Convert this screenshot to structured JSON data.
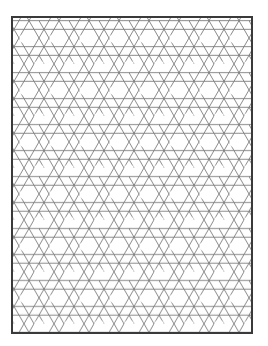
{
  "figure": {
    "type": "geometric-line-pattern",
    "pattern_name": "triaxial hexagram weave",
    "colors": {
      "background": "#ffffff",
      "line": "#7a7a7a",
      "border": "#3a3a3a"
    },
    "tile_spacing_px": 30
  }
}
